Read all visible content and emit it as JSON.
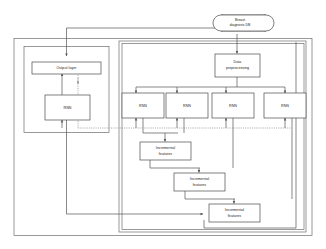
{
  "diagram": {
    "colors": {
      "background": "#ffffff",
      "box_stroke": "#4a4a4a",
      "container_stroke": "#6e6e6e",
      "connector": "#555555",
      "connector_dotted": "#8a8a8a",
      "text": "#1a1a1a"
    },
    "database": {
      "name": "breast-diagnosis-db",
      "label_line1": "Breast",
      "label_line2": "diagnosis DB"
    },
    "preprocessing": {
      "name": "data-preprocessing",
      "label_line1": "Data",
      "label_line2": "preprocessing"
    },
    "output_layer": {
      "name": "output-layer",
      "label": "Output layer"
    },
    "output_rnn": {
      "name": "output-rnn",
      "label": "RNN"
    },
    "rnn_bank": [
      {
        "name": "rnn-1",
        "label": "RNN"
      },
      {
        "name": "rnn-2",
        "label": "RNN"
      },
      {
        "name": "rnn-3",
        "label": "RNN"
      },
      {
        "name": "rnn-4",
        "label": "RNN"
      }
    ],
    "incremental_features": [
      {
        "name": "incremental-features-1",
        "label_line1": "Incremental",
        "label_line2": "features"
      },
      {
        "name": "incremental-features-2",
        "label_line1": "Incremental",
        "label_line2": "features"
      },
      {
        "name": "incremental-features-3",
        "label_line1": "Incremental",
        "label_line2": "features"
      }
    ],
    "containers": [
      {
        "name": "outer-container"
      },
      {
        "name": "left-module-container"
      },
      {
        "name": "right-module-container"
      },
      {
        "name": "right-module-inner-container"
      }
    ]
  }
}
